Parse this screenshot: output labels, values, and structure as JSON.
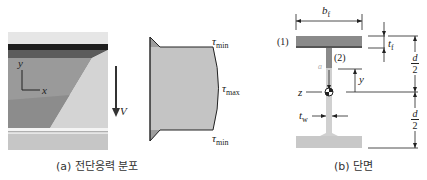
{
  "figure_a": {
    "caption": "(a) 전단응력 분포",
    "axis_y": "y",
    "axis_x": "x",
    "shear_force": "V",
    "tau": "τ",
    "tau_min_sub": "min",
    "tau_max_sub": "max"
  },
  "figure_b": {
    "caption": "(b) 단면",
    "flange_width": "b",
    "flange_width_sub": "f",
    "flange_thickness": "t",
    "flange_thickness_sub": "f",
    "web_thickness": "t",
    "web_thickness_sub": "w",
    "point_1": "(1)",
    "point_2": "(2)",
    "point_a": "a",
    "neutral_axis": "z",
    "distance_y": "y",
    "half_depth_num": "d",
    "half_depth_den": "2"
  },
  "colors": {
    "flange_dark": "#8a8a8a",
    "web_fill": "#c8c8c8",
    "stress_fill": "#c4c4c4",
    "line": "#222222"
  }
}
